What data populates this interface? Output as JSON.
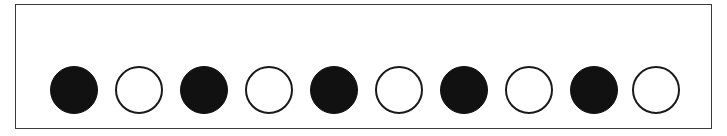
{
  "diagram": {
    "colors": {
      "filled": "#111111",
      "empty_fill": "#ffffff",
      "stroke": "#1a1a1a",
      "frame": "#3a3a3a"
    },
    "circles": [
      {
        "index": 1,
        "state": "filled",
        "cx": 74
      },
      {
        "index": 2,
        "state": "empty",
        "cx": 139
      },
      {
        "index": 3,
        "state": "filled",
        "cx": 204
      },
      {
        "index": 4,
        "state": "empty",
        "cx": 269
      },
      {
        "index": 5,
        "state": "filled",
        "cx": 334
      },
      {
        "index": 6,
        "state": "empty",
        "cx": 399
      },
      {
        "index": 7,
        "state": "filled",
        "cx": 464
      },
      {
        "index": 8,
        "state": "empty",
        "cx": 529
      },
      {
        "index": 9,
        "state": "filled",
        "cx": 594
      },
      {
        "index": 10,
        "state": "empty",
        "cx": 656
      }
    ],
    "circle_diameter": 48,
    "circle_cy": 90
  }
}
